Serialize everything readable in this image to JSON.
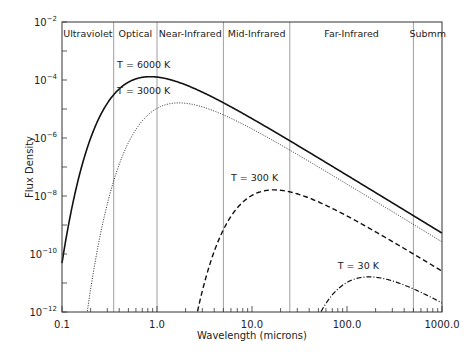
{
  "chart_data": {
    "type": "line",
    "title": "",
    "xlabel": "Wavelength (microns)",
    "ylabel": "Flux Density",
    "xscale": "log",
    "yscale": "log",
    "xlim": [
      0.1,
      1000
    ],
    "ylim": [
      1e-12,
      0.01
    ],
    "x_ticks": [
      "0.1",
      "1.0",
      "10.0",
      "100.0",
      "1000.0"
    ],
    "y_ticks": [
      "10^-12",
      "10^-10",
      "10^-8",
      "10^-6",
      "10^-4",
      "10^-2"
    ],
    "grid": false,
    "regions": [
      {
        "label": "Ultraviolet",
        "from": 0.1,
        "to": 0.35
      },
      {
        "label": "Optical",
        "from": 0.35,
        "to": 1.0
      },
      {
        "label": "Near-Infrared",
        "from": 1.0,
        "to": 5.0
      },
      {
        "label": "Mid-Infrared",
        "from": 5.0,
        "to": 25.0
      },
      {
        "label": "Far-Infrared",
        "from": 25.0,
        "to": 500.0
      },
      {
        "label": "Submm",
        "from": 500.0,
        "to": 1000.0
      }
    ],
    "series": [
      {
        "name": "T = 6000 K",
        "temperature": 6000,
        "style": "solid",
        "peak_wavelength": 0.85,
        "peak_flux": 0.00013
      },
      {
        "name": "T = 3000 K",
        "temperature": 3000,
        "style": "dotted",
        "peak_wavelength": 1.7,
        "peak_flux": 1.6e-05
      },
      {
        "name": "T = 300 K",
        "temperature": 300,
        "style": "dashed",
        "peak_wavelength": 17,
        "peak_flux": 1.6e-08
      },
      {
        "name": "T = 30 K",
        "temperature": 30,
        "style": "dashdot",
        "peak_wavelength": 170,
        "peak_flux": 1.6e-11
      }
    ],
    "annotations": [
      {
        "text": "T = 6000 K",
        "x": 0.38,
        "y": 0.00025
      },
      {
        "text": "T = 3000 K",
        "x": 0.38,
        "y": 3.2e-05
      },
      {
        "text": "T = 300 K",
        "x": 6.0,
        "y": 3.2e-08
      },
      {
        "text": "T = 30 K",
        "x": 80,
        "y": 3e-11
      }
    ]
  }
}
